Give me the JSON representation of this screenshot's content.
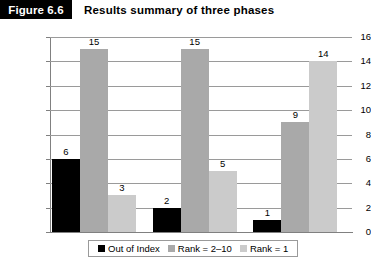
{
  "figure": {
    "tag": "Figure 6.6",
    "title": "Results summary of three phases"
  },
  "chart_data": {
    "type": "bar",
    "title": "Results summary of three phases",
    "xlabel": "",
    "ylabel": "",
    "ylim": [
      0,
      16
    ],
    "ytick_step": 2,
    "yticks": [
      16,
      14,
      12,
      10,
      8,
      6,
      4,
      2,
      0
    ],
    "grid": true,
    "legend_position": "bottom",
    "categories": [
      "Phase 1",
      "Phase 2",
      "Phase 3"
    ],
    "series": [
      {
        "name": "Out of Index",
        "color": "#000000",
        "values": [
          6,
          2,
          1
        ]
      },
      {
        "name": "Rank = 2–10",
        "color": "#a9a9a9",
        "values": [
          15,
          15,
          9
        ]
      },
      {
        "name": "Rank = 1",
        "color": "#cbcbcb",
        "values": [
          3,
          5,
          14
        ]
      }
    ],
    "data_labels": [
      [
        "6",
        "15",
        "3"
      ],
      [
        "2",
        "15",
        "5"
      ],
      [
        "1",
        "9",
        "14"
      ]
    ]
  }
}
